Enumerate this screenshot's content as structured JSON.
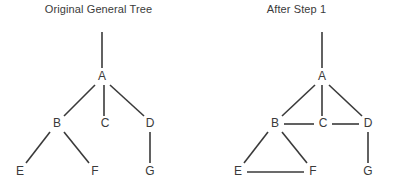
{
  "figure": {
    "background_color": "#ffffff",
    "ink_color": "#3a3a3a",
    "width": 395,
    "height": 192
  },
  "panels": [
    {
      "id": "original-general-tree",
      "title": "Original General Tree",
      "origin_x": 0,
      "root_stub": {
        "x": 102,
        "y1": 32,
        "y2": 68
      },
      "nodes": [
        {
          "id": "A",
          "label": "A",
          "x": 102,
          "y": 77
        },
        {
          "id": "B",
          "label": "B",
          "x": 57,
          "y": 124
        },
        {
          "id": "C",
          "label": "C",
          "x": 105,
          "y": 124
        },
        {
          "id": "D",
          "label": "D",
          "x": 150,
          "y": 124
        },
        {
          "id": "E",
          "label": "E",
          "x": 20,
          "y": 172
        },
        {
          "id": "F",
          "label": "F",
          "x": 95,
          "y": 172
        },
        {
          "id": "G",
          "label": "G",
          "x": 150,
          "y": 172
        }
      ],
      "edges": [
        {
          "from": "A",
          "to": "B",
          "kind": "parent-child",
          "x1": 95,
          "y1": 85,
          "x2": 64,
          "y2": 116
        },
        {
          "from": "A",
          "to": "C",
          "kind": "parent-child",
          "x1": 104,
          "y1": 85,
          "x2": 104,
          "y2": 116
        },
        {
          "from": "A",
          "to": "D",
          "kind": "parent-child",
          "x1": 110,
          "y1": 85,
          "x2": 144,
          "y2": 116
        },
        {
          "from": "B",
          "to": "E",
          "kind": "parent-child",
          "x1": 50,
          "y1": 132,
          "x2": 26,
          "y2": 163
        },
        {
          "from": "B",
          "to": "F",
          "kind": "parent-child",
          "x1": 64,
          "y1": 132,
          "x2": 89,
          "y2": 163
        },
        {
          "from": "D",
          "to": "G",
          "kind": "parent-child",
          "x1": 150,
          "y1": 132,
          "x2": 150,
          "y2": 163
        }
      ]
    },
    {
      "id": "after-step-1",
      "title": "After Step 1",
      "origin_x": 198,
      "root_stub": {
        "x": 124,
        "y1": 32,
        "y2": 68
      },
      "nodes": [
        {
          "id": "A",
          "label": "A",
          "x": 124,
          "y": 77
        },
        {
          "id": "B",
          "label": "B",
          "x": 77,
          "y": 124
        },
        {
          "id": "C",
          "label": "C",
          "x": 125,
          "y": 124
        },
        {
          "id": "D",
          "label": "D",
          "x": 170,
          "y": 124
        },
        {
          "id": "E",
          "label": "E",
          "x": 40,
          "y": 172
        },
        {
          "id": "F",
          "label": "F",
          "x": 115,
          "y": 172
        },
        {
          "id": "G",
          "label": "G",
          "x": 170,
          "y": 172
        }
      ],
      "edges": [
        {
          "from": "A",
          "to": "B",
          "kind": "parent-child",
          "x1": 117,
          "y1": 85,
          "x2": 84,
          "y2": 116
        },
        {
          "from": "A",
          "to": "C",
          "kind": "parent-child",
          "x1": 124,
          "y1": 85,
          "x2": 124,
          "y2": 116
        },
        {
          "from": "A",
          "to": "D",
          "kind": "parent-child",
          "x1": 131,
          "y1": 85,
          "x2": 164,
          "y2": 116
        },
        {
          "from": "B",
          "to": "C",
          "kind": "sibling",
          "x1": 86,
          "y1": 124,
          "x2": 116,
          "y2": 124
        },
        {
          "from": "C",
          "to": "D",
          "kind": "sibling",
          "x1": 134,
          "y1": 124,
          "x2": 161,
          "y2": 124
        },
        {
          "from": "B",
          "to": "E",
          "kind": "parent-child",
          "x1": 70,
          "y1": 132,
          "x2": 46,
          "y2": 163
        },
        {
          "from": "B",
          "to": "F",
          "kind": "parent-child",
          "x1": 84,
          "y1": 132,
          "x2": 109,
          "y2": 163
        },
        {
          "from": "E",
          "to": "F",
          "kind": "sibling",
          "x1": 49,
          "y1": 172,
          "x2": 106,
          "y2": 172
        },
        {
          "from": "D",
          "to": "G",
          "kind": "parent-child",
          "x1": 170,
          "y1": 132,
          "x2": 170,
          "y2": 163
        }
      ]
    }
  ]
}
